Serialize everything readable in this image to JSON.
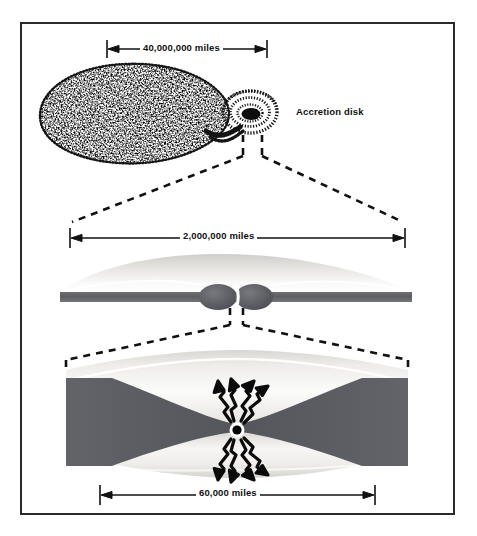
{
  "figure": {
    "domain": "diagram",
    "title_visible": false,
    "background_color": "#ffffff",
    "frame_color": "#2a2a2a",
    "ink_color": "#111111"
  },
  "labels": {
    "accretion_disk": "Accretion disk"
  },
  "dimensions": [
    {
      "id": "top",
      "text": "40,000,000 miles",
      "panel": "binary-star-system"
    },
    {
      "id": "middle",
      "text": "2,000,000 miles",
      "panel": "accretion-disk-edge-on"
    },
    {
      "id": "bottom",
      "text": "60,000 miles",
      "panel": "inner-disk-black-hole"
    }
  ],
  "panels": [
    {
      "id": "panel-top",
      "name": "binary-star-system",
      "description": "Stippled teardrop companion star streaming mass into a spiral accretion disk",
      "scale_label": "40,000,000 miles"
    },
    {
      "id": "panel-middle",
      "name": "accretion-disk-edge-on",
      "description": "Edge-on flared accretion disk with dark mid-plane band and two central bulges",
      "scale_label": "2,000,000 miles"
    },
    {
      "id": "panel-bottom",
      "name": "inner-disk-black-hole",
      "description": "Inner disk funnel cross-section with central black hole emitting radiation",
      "scale_label": "60,000 miles",
      "radiation_arrows": {
        "up": 4,
        "down": 4
      }
    }
  ],
  "colors": {
    "disk_dark": "#5f6064",
    "disk_light": "#f2f1ef",
    "stipple": "#141414",
    "black_hole": "#000000"
  }
}
